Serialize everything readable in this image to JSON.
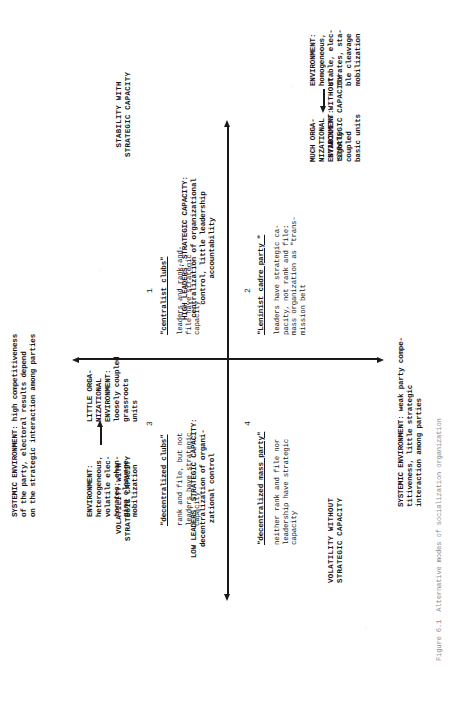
{
  "figure": {
    "caption": "Figure 6.1  Alternative modes of socialization organization"
  },
  "axes": {
    "vertical_top_label": "SYSTEMIC ENVIRONMENT: high competitiveness\nof the party, electoral results depend\non the strategic interaction among parties",
    "vertical_bottom_label": "SYSTEMIC ENVIRONMENT: weak party compe-\ntitiveness, little strategic\ninteraction among parties",
    "horizontal_right_label": "HIGH LEADERS' STRATEGIC CAPACITY:\ncentralization of organizational\ncontrol, little leadership\naccountability",
    "horizontal_left_label": "LOW LEADERS' STRATEGIC CAPACITY:\ndecentralization of organi-\nzational control"
  },
  "corners": {
    "top_left": "VOLATILITY WITH\nSTRATEGIC CAPACITY",
    "top_right": "STABILITY WITH\nSTRATEGIC CAPACITY",
    "bottom_left": "VOLATILITY WITHOUT\nSTRATEGIC CAPACITY",
    "bottom_right": "STABILITY WITHOUT\nSTRATEGIC CAPACITY"
  },
  "quadrants": [
    {
      "number": "1",
      "title": "\"centralist clubs\"",
      "body": "leaders and rank-and-\nfile have strategic\ncapacity",
      "org_label": "LITTLE ORGA-\nNIZATIONAL\nENVIRONMENT:\nloosely coupled\ngrassroots\nunits",
      "env_label": "ENVIRONMENT:\nheterogeneous,\nvolatile elec-\ntorates; chan-\nging cleavage\nmobilization"
    },
    {
      "number": "2",
      "title": "\"Leninist cadre party \"",
      "body": "leaders have strategic ca-\npacity, not rank and file:\nmass organization as \"trans-\nmission belt",
      "org_label": "MUCH ORGA-\nNIZATIONAL\nENVIRONMENT:\ntightly\ncoupled\nbasic units",
      "env_label": "ENVIRONMENT:\nhomogeneous,\nstable, elec-\ntorates, sta-\nble cleavage\nmobilization"
    },
    {
      "number": "3",
      "title": "\"decentralized clubs\"",
      "body": "rank and file, but not\nleaders have strategic\ncapacity",
      "org_label": "",
      "env_label": ""
    },
    {
      "number": "4",
      "title": "\"decentralized mass party\"",
      "body": "neither rank and file nor\nleadership have strategic\ncapacity",
      "org_label": "",
      "env_label": ""
    }
  ],
  "colors": {
    "ink": "#17161a",
    "paper": "#ffffff"
  }
}
